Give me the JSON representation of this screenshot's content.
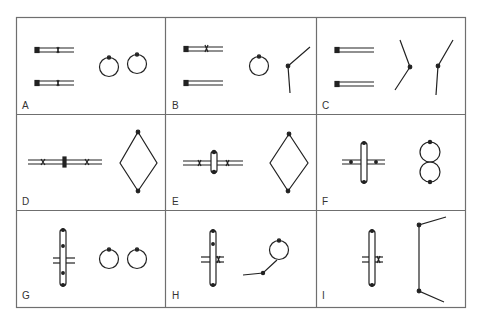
{
  "figure": {
    "grid": {
      "rows": 3,
      "cols": 3,
      "border_color": "#6f6f6f",
      "stroke_color": "#222222"
    },
    "panels": [
      {
        "id": "A",
        "label": "A",
        "left": "two-rods-with-centromere",
        "right": "two-rings"
      },
      {
        "id": "B",
        "label": "B",
        "left": "rod-with-centromere-and-plain-rod",
        "right": "ring-and-v-shape"
      },
      {
        "id": "C",
        "label": "C",
        "left": "two-plain-rods",
        "right": "two-bent-rods"
      },
      {
        "id": "D",
        "label": "D",
        "left": "bivalent-chain-with-marks",
        "right": "diamond"
      },
      {
        "id": "E",
        "label": "E",
        "left": "cross-with-short-arms",
        "right": "diamond"
      },
      {
        "id": "F",
        "label": "F",
        "left": "cross-equal-arms",
        "right": "figure-eight"
      },
      {
        "id": "G",
        "label": "G",
        "left": "long-cross",
        "right": "two-rings"
      },
      {
        "id": "H",
        "label": "H",
        "left": "long-cross-with-mark",
        "right": "ring-with-tail"
      },
      {
        "id": "I",
        "label": "I",
        "left": "long-cross-with-mark",
        "right": "open-bracket"
      }
    ]
  }
}
